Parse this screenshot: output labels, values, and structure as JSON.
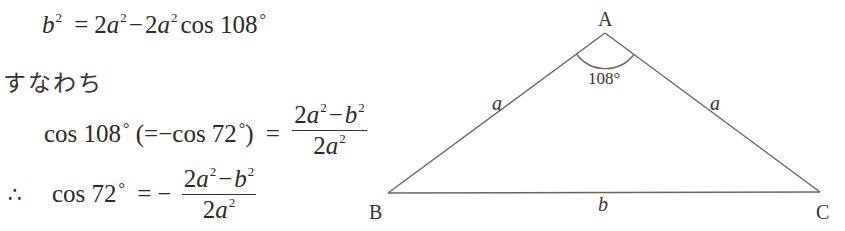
{
  "equations": {
    "line1": {
      "lhs_var": "b",
      "lhs_exp": "2",
      "eq": "=",
      "t1_coef": "2",
      "t1_var": "a",
      "t1_exp": "2",
      "minus": "−",
      "t2_coef": "2",
      "t2_var": "a",
      "t2_exp": "2",
      "t2_func": "cos",
      "t2_angle": "108",
      "deg": "°"
    },
    "connector_text": "すなわち",
    "line2": {
      "func": "cos",
      "angle": "108",
      "deg": "°",
      "paren_open": "(",
      "paren_eq": "=",
      "paren_minus": "−",
      "paren_func": "cos",
      "paren_angle": "72",
      "paren_deg": "°",
      "paren_close": ")",
      "eq": "=",
      "num_coef": "2",
      "num_var1": "a",
      "num_exp1": "2",
      "num_minus": "−",
      "num_var2": "b",
      "num_exp2": "2",
      "den_coef": "2",
      "den_var": "a",
      "den_exp": "2"
    },
    "line3": {
      "therefore": "∴",
      "func": "cos",
      "angle": "72",
      "deg": "°",
      "eq": "=",
      "neg": "−",
      "num_coef": "2",
      "num_var1": "a",
      "num_exp1": "2",
      "num_minus": "−",
      "num_var2": "b",
      "num_exp2": "2",
      "den_coef": "2",
      "den_var": "a",
      "den_exp": "2"
    }
  },
  "diagram": {
    "type": "isosceles-triangle",
    "vertices": {
      "A": {
        "label": "A",
        "x": 605,
        "y": 33
      },
      "B": {
        "label": "B",
        "x": 388,
        "y": 193
      },
      "C": {
        "label": "C",
        "x": 820,
        "y": 192
      }
    },
    "sides": {
      "AB": {
        "label": "a"
      },
      "AC": {
        "label": "a"
      },
      "BC": {
        "label": "b"
      }
    },
    "angle_A": {
      "label": "108°"
    },
    "line_color": "#555555"
  }
}
